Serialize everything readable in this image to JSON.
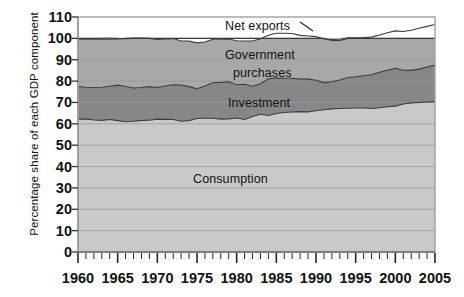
{
  "chart_data": {
    "type": "area",
    "stacked": true,
    "title": "",
    "xlabel": "",
    "ylabel": "Percentage share of each GDP component",
    "xlim": [
      1960,
      2005
    ],
    "ylim": [
      0,
      110
    ],
    "ytick_labels": [
      "0",
      "10",
      "20",
      "30",
      "40",
      "50",
      "60",
      "70",
      "80",
      "90",
      "100",
      "110"
    ],
    "ytick_values": [
      0,
      10,
      20,
      30,
      40,
      50,
      60,
      70,
      80,
      90,
      100,
      110
    ],
    "xtick_labels": [
      "1960",
      "1965",
      "1970",
      "1975",
      "1980",
      "1985",
      "1990",
      "1995",
      "2000",
      "2005"
    ],
    "xtick_values": [
      1960,
      1965,
      1970,
      1975,
      1980,
      1985,
      1990,
      1995,
      2000,
      2005
    ],
    "minor_xtick_interval": 1,
    "grid": "horizontal",
    "legend": "inline-annotations",
    "colors": {
      "consumption": "#c9c9c9",
      "investment": "#878787",
      "government": "#a8a8a8",
      "net_exports": "#ffffff",
      "plot_border": "#a0a0a0",
      "gridline": "#9a9a9a",
      "axis": "#333333",
      "text": "#111111"
    },
    "x": [
      1960,
      1961,
      1962,
      1963,
      1964,
      1965,
      1966,
      1967,
      1968,
      1969,
      1970,
      1971,
      1972,
      1973,
      1974,
      1975,
      1976,
      1977,
      1978,
      1979,
      1980,
      1981,
      1982,
      1983,
      1984,
      1985,
      1986,
      1987,
      1988,
      1989,
      1990,
      1991,
      1992,
      1993,
      1994,
      1995,
      1996,
      1997,
      1998,
      1999,
      2000,
      2001,
      2002,
      2003,
      2004,
      2005
    ],
    "series": [
      {
        "name": "Consumption",
        "label": "Consumption",
        "color": "#c9c9c9",
        "values": [
          62.0,
          62.3,
          61.8,
          61.6,
          62.0,
          61.5,
          61.0,
          61.2,
          61.6,
          61.7,
          62.2,
          62.1,
          62.0,
          61.2,
          61.5,
          62.5,
          62.6,
          62.6,
          62.2,
          62.3,
          62.7,
          62.0,
          63.4,
          64.5,
          63.9,
          64.8,
          65.3,
          65.5,
          65.7,
          65.6,
          66.1,
          66.6,
          67.0,
          67.2,
          67.3,
          67.4,
          67.4,
          67.2,
          67.5,
          68.0,
          68.3,
          69.3,
          69.8,
          70.0,
          70.2,
          70.4
        ]
      },
      {
        "name": "Investment",
        "label": "Investment",
        "color": "#878787",
        "values": [
          15.5,
          14.8,
          15.2,
          15.5,
          15.6,
          16.6,
          16.5,
          15.6,
          15.4,
          15.7,
          14.8,
          15.6,
          16.3,
          17.0,
          15.9,
          13.9,
          15.1,
          16.6,
          17.2,
          17.4,
          15.6,
          16.5,
          14.2,
          14.3,
          17.2,
          16.6,
          16.0,
          15.8,
          15.3,
          15.3,
          14.3,
          12.7,
          12.7,
          13.3,
          14.4,
          14.6,
          15.1,
          15.8,
          16.6,
          17.1,
          17.7,
          15.8,
          15.2,
          15.6,
          16.4,
          17.1
        ]
      },
      {
        "name": "Government purchases",
        "label": "Government\npurchases",
        "color": "#a8a8a8",
        "values": [
          22.1,
          22.5,
          22.6,
          22.5,
          22.0,
          21.6,
          22.5,
          23.4,
          23.2,
          22.6,
          22.5,
          22.0,
          21.6,
          20.6,
          21.4,
          21.5,
          20.6,
          20.4,
          20.2,
          20.0,
          20.6,
          20.3,
          21.2,
          21.0,
          20.4,
          21.0,
          21.1,
          21.0,
          20.4,
          20.2,
          20.4,
          20.4,
          19.8,
          19.1,
          18.6,
          18.3,
          17.9,
          17.6,
          17.5,
          17.5,
          17.5,
          18.1,
          18.8,
          19.1,
          19.0,
          19.0
        ]
      },
      {
        "name": "Net exports",
        "label": "Net exports",
        "color": "#ffffff",
        "values": [
          0.4,
          0.4,
          0.4,
          0.4,
          0.6,
          0.3,
          -0.1,
          -0.2,
          -0.2,
          0.0,
          0.5,
          0.3,
          0.1,
          1.2,
          1.2,
          2.1,
          1.7,
          0.4,
          0.4,
          0.3,
          1.1,
          1.2,
          1.2,
          0.2,
          -1.5,
          -2.4,
          -2.4,
          -2.3,
          -1.4,
          -1.1,
          -0.8,
          0.3,
          -0.5,
          -0.6,
          -0.3,
          -0.3,
          -0.4,
          -0.6,
          -1.6,
          -2.6,
          -3.5,
          -3.2,
          -3.8,
          -4.7,
          -5.6,
          -6.5
        ]
      }
    ],
    "annotations": [
      {
        "name": "net-exports-leader",
        "from": "Net exports",
        "style": "short-line"
      }
    ]
  }
}
